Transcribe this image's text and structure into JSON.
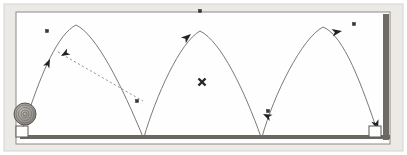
{
  "figure": {
    "width": 407,
    "height": 155,
    "background_color": "#ffffff",
    "outer_mat_color": "#eceae7",
    "frame_border_color": "#9b9892",
    "canvas_color": "#fefefe"
  },
  "frame": {
    "outer": {
      "x": 4,
      "y": 4,
      "width": 399,
      "height": 147
    },
    "inner": {
      "x": 16,
      "y": 12,
      "width": 374,
      "height": 132
    },
    "inner_border_color": "#8d8a85",
    "wall_right": {
      "label": "right-wall",
      "x": 383,
      "y": 14,
      "width": 6,
      "height": 126,
      "color": "#6e6b66"
    },
    "ground": {
      "label": "ground-line",
      "x1": 20,
      "x2": 390,
      "y": 137,
      "thickness": 4,
      "color": "#6b6864"
    }
  },
  "ball": {
    "label": "ball",
    "cx": 25,
    "cy": 114,
    "r": 11,
    "fill": "#9d9a95",
    "ring_color": "#6f6c67",
    "stroke": "#57544f",
    "rings": [
      9,
      6.5,
      4,
      2
    ]
  },
  "start_marker": {
    "label": "start-box",
    "x": 16,
    "y": 126,
    "width": 12,
    "height": 11,
    "fill": "#ffffff",
    "stroke": "#595652"
  },
  "end_marker": {
    "label": "end-box",
    "x": 369,
    "y": 126,
    "width": 12,
    "height": 11,
    "fill": "#ffffff",
    "stroke": "#595652"
  },
  "trajectory": {
    "stroke": "#6d6a66",
    "stroke_width": 0.9,
    "arcs": [
      {
        "name": "arc-1",
        "path": "M 28 114 C 42 72 58 34 76 25 C 96 34 122 86 143 137",
        "start": [
          28,
          114
        ],
        "peak": [
          76,
          25
        ],
        "end": [
          143,
          137
        ]
      },
      {
        "name": "arc-2",
        "path": "M 144 137 C 156 96 180 42 200 31 C 221 41 245 92 261 137",
        "start": [
          144,
          137
        ],
        "peak": [
          200,
          31
        ],
        "end": [
          261,
          137
        ]
      },
      {
        "name": "arc-3",
        "path": "M 262 137 C 274 94 302 38 323 27 C 344 35 362 86 378 133",
        "start": [
          262,
          137
        ],
        "peak": [
          323,
          27
        ],
        "end": [
          378,
          133
        ]
      }
    ]
  },
  "dashed_line": {
    "name": "reference-dashed-line",
    "x1": 58,
    "y1": 52,
    "x2": 143,
    "y2": 101,
    "stroke": "#8a8782",
    "dash": "2.2 2.4",
    "stroke_width": 0.9
  },
  "arrowheads": [
    {
      "name": "arrow-ascend-1",
      "x": 50,
      "y": 59,
      "angle": -65,
      "size": 9
    },
    {
      "name": "arrow-dashed-reverse",
      "x": 61,
      "y": 56,
      "angle": 150,
      "size": 9
    },
    {
      "name": "arrow-ascend-2",
      "x": 191,
      "y": 34,
      "angle": -40,
      "size": 10
    },
    {
      "name": "arrow-bounce-2",
      "x": 263,
      "y": 114,
      "angle": 205,
      "size": 9
    },
    {
      "name": "arrow-peak-3",
      "x": 342,
      "y": 31,
      "angle": -10,
      "size": 10
    },
    {
      "name": "arrow-descend-end",
      "x": 378,
      "y": 128,
      "angle": 72,
      "size": 10
    }
  ],
  "square_markers": [
    {
      "name": "marker-arc1-peak-label",
      "x": 47,
      "y": 31
    },
    {
      "name": "marker-top-center",
      "x": 200,
      "y": 11
    },
    {
      "name": "marker-bounce-1",
      "x": 137,
      "y": 101
    },
    {
      "name": "marker-bounce-2",
      "x": 268,
      "y": 111
    },
    {
      "name": "marker-arc3-peak",
      "x": 354,
      "y": 24
    }
  ],
  "square_marker_style": {
    "size": 3,
    "fill": "#3a3734",
    "stroke": "#2c2a27"
  },
  "cross_marker": {
    "name": "center-cross-marker",
    "cx": 202,
    "cy": 82,
    "size": 4,
    "color": "#2b2926",
    "stroke_width": 2.4
  }
}
